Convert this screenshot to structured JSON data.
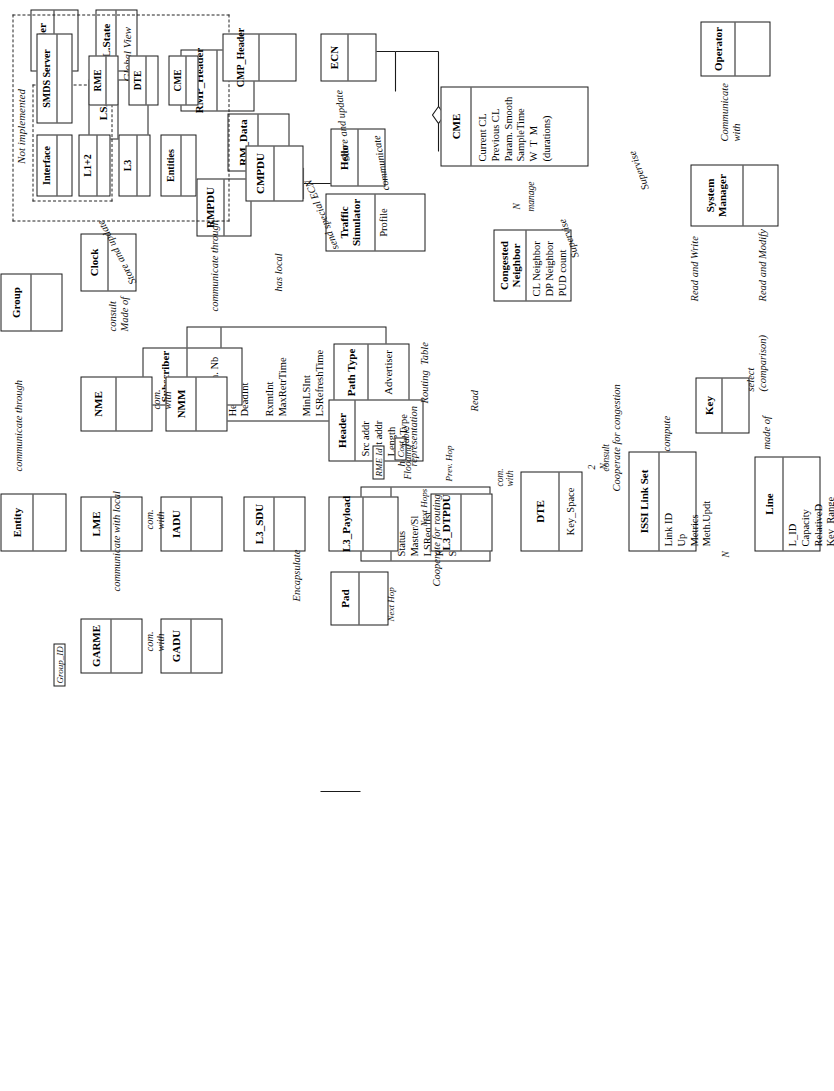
{
  "diagram": {
    "orientation": "rotated-90-ccw",
    "line_color": "#1a1a1a",
    "background": "#ffffff"
  },
  "classes": {
    "header": {
      "name": "Header",
      "attrs": ""
    },
    "lstate": {
      "name": "L.State",
      "attrs": ""
    },
    "lsa": {
      "name": "LSA",
      "attrs": ""
    },
    "hello": {
      "name": "Hello",
      "attrs": ""
    },
    "rmp_header": {
      "name": "RMP_Header",
      "attrs": ""
    },
    "rm_data": {
      "name": "RM_Data",
      "attrs": ""
    },
    "rmpdu": {
      "name": "RMPDU",
      "attrs": ""
    },
    "traffic_sim": {
      "name": "Traffic Simulator",
      "attrs": "Profile"
    },
    "rme": {
      "name": "RME",
      "attrs": "HelloInt\nDeadInt\n\nRxmtInt\nMaxRetrTime\n\nMinLSInt\nLSRefreshTime\n\nInfTransDelay\n\nMaxAge\nMaxAgeDiff"
    },
    "group": {
      "name": "Group",
      "attrs": ""
    },
    "subscriber": {
      "name": "Subscriber",
      "attrs": "Exch. Nb"
    },
    "path_type": {
      "name": "Path Type",
      "attrs": "Advertiser"
    },
    "neighbor": {
      "name": "Neighbor",
      "attrs": "Status\nMaster/Sl\nLSReq list\nRetr. list\nSummary"
    },
    "entity": {
      "name": "Entity",
      "attrs": ""
    },
    "garme": {
      "name": "GARME",
      "attrs": ""
    },
    "gadu": {
      "name": "GADU",
      "attrs": ""
    },
    "lme": {
      "name": "LME",
      "attrs": ""
    },
    "iadu": {
      "name": "IADU",
      "attrs": ""
    },
    "nme": {
      "name": "NME",
      "attrs": ""
    },
    "nmm": {
      "name": "NMM",
      "attrs": ""
    },
    "l3_sdu": {
      "name": "L3_SDU",
      "attrs": ""
    },
    "pad": {
      "name": "Pad",
      "attrs": ""
    },
    "l3_payload": {
      "name": "L3_Payload",
      "attrs": ""
    },
    "l3_header": {
      "name": "Header",
      "attrs": "Src addr\nDst addr\nLength\nServ Type"
    },
    "l3_dtpdu": {
      "name": "L3_DTPDU",
      "attrs": ""
    },
    "dte": {
      "name": "DTE",
      "attrs": "Key_Space"
    },
    "issi_link_set": {
      "name": "ISSI Link Set",
      "attrs": "Link ID\nUp\nMetrics\nMeth.Updt"
    },
    "key": {
      "name": "Key",
      "attrs": ""
    },
    "line": {
      "name": "Line",
      "attrs": "L_ID\nCapacity\nRelativeD\nKey_Range"
    },
    "clock": {
      "name": "Clock",
      "attrs": ""
    },
    "smds_server": {
      "name": "SMDS Server",
      "attrs": ""
    },
    "interface": {
      "name": "Interface",
      "attrs": ""
    },
    "l12": {
      "name": "L1+2",
      "attrs": ""
    },
    "l3": {
      "name": "L3",
      "attrs": ""
    },
    "entities": {
      "name": "Entities",
      "attrs": ""
    },
    "gv_rme": {
      "name": "RME",
      "attrs": ""
    },
    "gv_dte": {
      "name": "DTE",
      "attrs": ""
    },
    "gv_cme": {
      "name": "CME",
      "attrs": ""
    },
    "cmpdu": {
      "name": "CMPDU",
      "attrs": ""
    },
    "cmp_header": {
      "name": "CMP_Header",
      "attrs": ""
    },
    "ecn": {
      "name": "ECN",
      "attrs": ""
    },
    "congested_nb": {
      "name": "Congested\nNeighbor",
      "attrs": "CL Neighbor\nDP Neighbor\nPUD count"
    },
    "cme": {
      "name": "CME",
      "attrs": "Current CL\nPrevious CL\nParam. Smooth\nSampleTime\nW  T  M\n(durations)"
    },
    "system_mgr": {
      "name": "System\nManager",
      "attrs": ""
    },
    "operator": {
      "name": "Operator",
      "attrs": ""
    }
  },
  "labels": {
    "store_and_update": "Store and update",
    "communicate_through": "communicate through",
    "has_local": "has local",
    "made_of_group": "Made of",
    "communicate_with_local": "communicate with local",
    "communicate_through_entity": "communicate through",
    "com_with_1": "com.\nwith",
    "com_with_2": "com.\nwith",
    "com_with_3": "com.\nwith",
    "com_with_dte": "com.\nwith",
    "group_id": "Group_ID",
    "encapsulate": "Encapsulate",
    "routing_table": "Routing  Table",
    "cooperate_for_routing": "Cooperate for routing",
    "cooperate_for_congestion": "Cooperate for congestion",
    "has_a_representation": "has a\nrepresentation",
    "rme_id": "RME Id",
    "next_hops": "Next Hops",
    "flooding": "Flooding",
    "cost": "Cost",
    "table": "Table",
    "prev_hop": "Prev. Hop",
    "next_hop": "Next Hop",
    "read": "Read",
    "consult_dte": "consult",
    "compute": "compute",
    "made_of_line": "made of",
    "select_comparison": "select\n(comparison)",
    "read_and_write": "Read and Write",
    "read_and_modify": "Read and Modify",
    "supervise_1": "Supervise",
    "supervise_2": "Supervise",
    "communicate_with_op": "Communicate\nwith",
    "consult_clock": "consult",
    "send_special_ecn": "send special ECN",
    "communicate_cme": "communicate",
    "store_and_update_ecn": "Store and update",
    "manage": "manage",
    "not_implemented": "Not implemented",
    "global_view": "Global View",
    "mult_N_issi": "N",
    "mult_2": "2",
    "mult_N_key": "N",
    "mult_N_manage": "N"
  }
}
